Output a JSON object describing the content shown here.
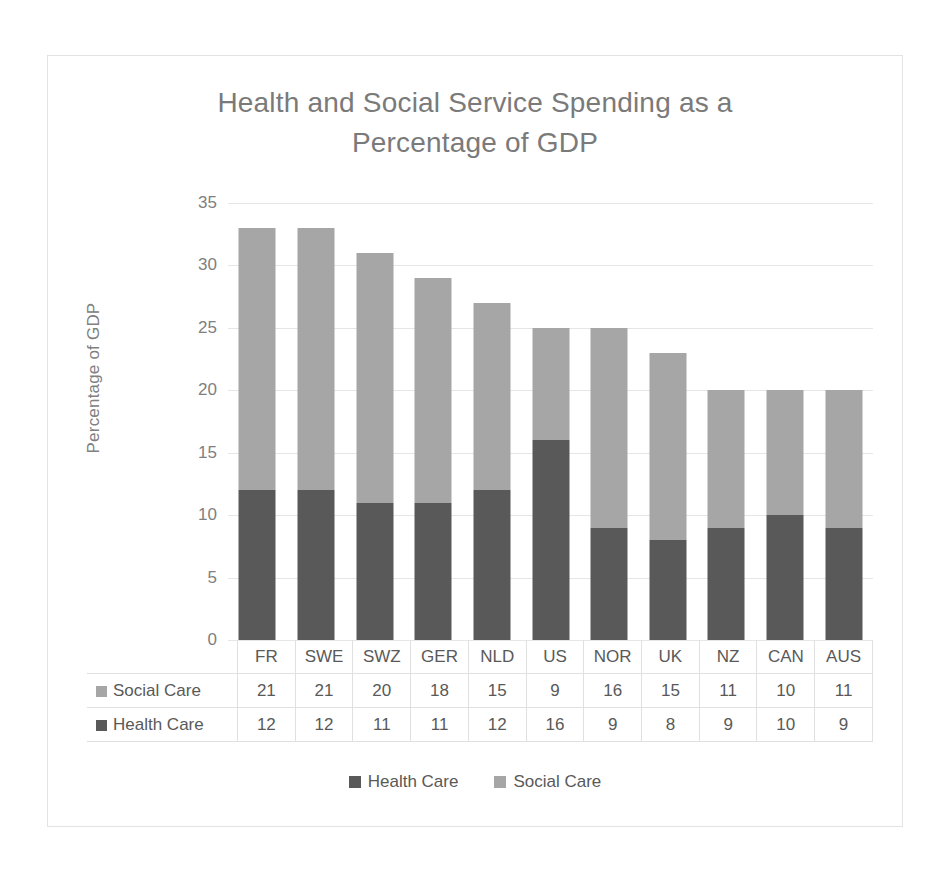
{
  "chart_data": {
    "type": "bar",
    "subtype": "stacked-column",
    "title": "Health and Social Service Spending as a Percentage of GDP",
    "title_lines": [
      "Health and Social Service Spending as a",
      "Percentage of GDP"
    ],
    "xlabel": "",
    "ylabel": "Percentage of GDP",
    "ylim": [
      0,
      35
    ],
    "ytick_step": 5,
    "yticks": [
      35,
      30,
      25,
      20,
      15,
      10,
      5,
      0
    ],
    "grid": true,
    "legend_position": "bottom",
    "data_table_visible": true,
    "categories": [
      "FR",
      "SWE",
      "SWZ",
      "GER",
      "NLD",
      "US",
      "NOR",
      "UK",
      "NZ",
      "CAN",
      "AUS"
    ],
    "series": [
      {
        "name": "Health Care",
        "color": "#595959",
        "values": [
          12,
          12,
          11,
          11,
          12,
          16,
          9,
          8,
          9,
          10,
          9
        ]
      },
      {
        "name": "Social Care",
        "color": "#a6a6a6",
        "values": [
          21,
          21,
          20,
          18,
          15,
          9,
          16,
          15,
          11,
          10,
          11
        ]
      }
    ],
    "totals": [
      33,
      33,
      31,
      29,
      27,
      25,
      25,
      23,
      20,
      20,
      20
    ]
  },
  "legend": {
    "items": [
      {
        "label": "Health Care",
        "color": "#595959"
      },
      {
        "label": "Social Care",
        "color": "#a6a6a6"
      }
    ]
  },
  "colors": {
    "health_care": "#595959",
    "social_care": "#a6a6a6",
    "gridline": "#e6e6e6",
    "border": "#e3e3e3",
    "text": "#7a7a7a",
    "background": "#ffffff"
  }
}
